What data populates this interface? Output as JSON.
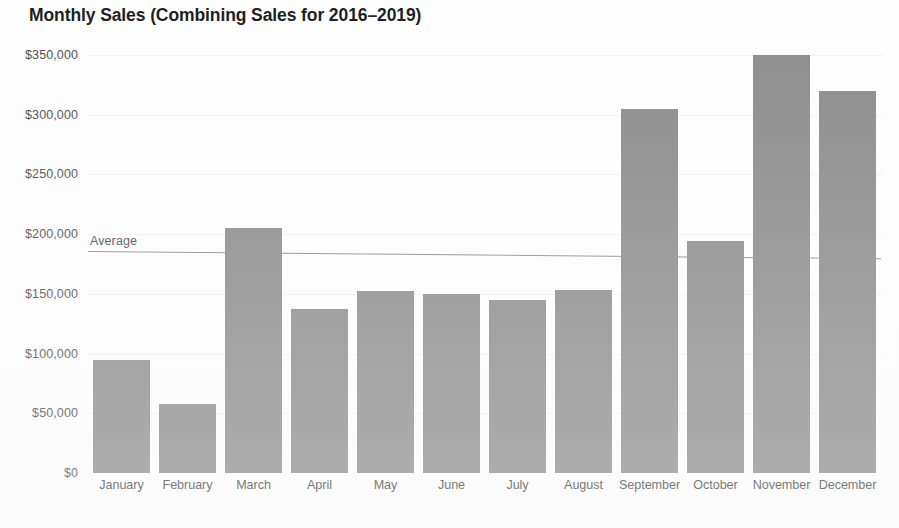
{
  "chart_data": {
    "type": "bar",
    "title": "Monthly Sales (Combining Sales for 2016–2019)",
    "xlabel": "",
    "ylabel": "",
    "categories": [
      "January",
      "February",
      "March",
      "April",
      "May",
      "June",
      "July",
      "August",
      "September",
      "October",
      "November",
      "December"
    ],
    "values": [
      95000,
      58000,
      205000,
      137000,
      152000,
      150000,
      145000,
      153000,
      305000,
      194000,
      350000,
      320000
    ],
    "ylim": [
      0,
      350000
    ],
    "y_ticks": [
      0,
      50000,
      100000,
      150000,
      200000,
      250000,
      300000,
      350000
    ],
    "y_tick_labels": [
      "$0",
      "$50,000",
      "$100,000",
      "$150,000",
      "$200,000",
      "$250,000",
      "$300,000",
      "$350,000"
    ],
    "grid": true,
    "legend": false,
    "bar_color": "#8b8b8b",
    "annotations": [
      {
        "name": "average",
        "label": "Average",
        "value": 186000,
        "line_color": "#8d8d8d"
      }
    ]
  }
}
